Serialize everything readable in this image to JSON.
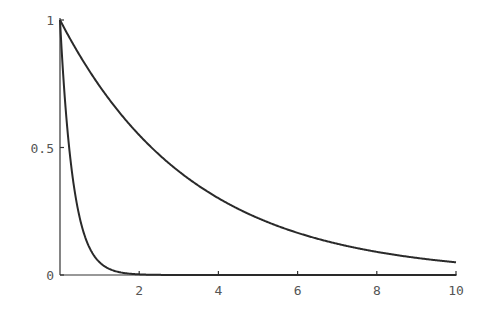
{
  "chart_data": {
    "type": "line",
    "title": "",
    "xlabel": "",
    "ylabel": "",
    "xlim": [
      0,
      10
    ],
    "ylim": [
      0,
      1
    ],
    "grid": false,
    "x_ticks": [
      "2",
      "4",
      "6",
      "8",
      "10"
    ],
    "y_ticks": [
      "0",
      "0.5",
      "1"
    ],
    "series": [
      {
        "name": "fast decay (~e^-3x)",
        "x": [
          0,
          0.1,
          0.2,
          0.3,
          0.4,
          0.5,
          0.6,
          0.8,
          1.0,
          1.2,
          1.5,
          2.0,
          10
        ],
        "values": [
          1.0,
          0.74,
          0.55,
          0.41,
          0.3,
          0.22,
          0.17,
          0.09,
          0.05,
          0.03,
          0.01,
          0.0,
          0.0
        ]
      },
      {
        "name": "slow decay (~e^-0.3x)",
        "x": [
          0,
          1,
          2,
          3,
          4,
          5,
          6,
          7,
          8,
          9,
          10
        ],
        "values": [
          1.0,
          0.74,
          0.55,
          0.41,
          0.3,
          0.22,
          0.17,
          0.12,
          0.09,
          0.07,
          0.05
        ]
      }
    ]
  }
}
